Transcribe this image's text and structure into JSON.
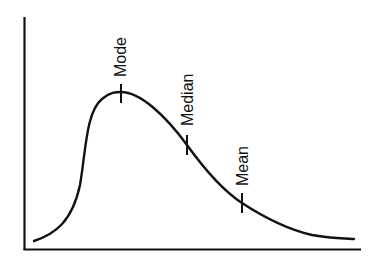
{
  "diagram": {
    "type": "skewed-distribution-curve",
    "colors": {
      "stroke": "#111111",
      "background": "#ffffff"
    },
    "axes": {
      "x_label": "",
      "y_label": "",
      "tick_labels": false
    },
    "markers": [
      {
        "id": "mode",
        "label": "Mode",
        "position": "peak of curve"
      },
      {
        "id": "median",
        "label": "Median",
        "position": "middle of descending slope"
      },
      {
        "id": "mean",
        "label": "Mean",
        "position": "lower on descending tail"
      }
    ]
  }
}
